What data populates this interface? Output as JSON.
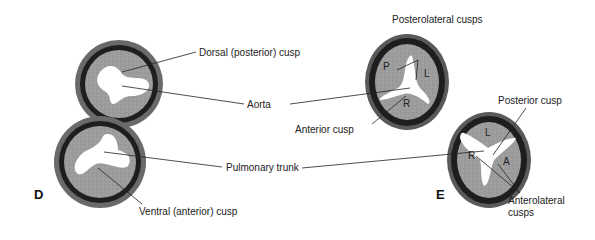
{
  "panels": {
    "D": {
      "label": "D",
      "labels": {
        "dorsal": "Dorsal (posterior) cusp",
        "ventral": "Ventral (anterior) cusp"
      }
    },
    "E": {
      "label": "E",
      "labels": {
        "posterolateral": "Posterolateral cusps",
        "anterior": "Anterior cusp",
        "posterior": "Posterior cusp",
        "anterolateral_line1": "Anterolateral",
        "anterolateral_line2": "cusps"
      },
      "aorta_cusps": {
        "P": "P",
        "L": "L",
        "R": "R"
      },
      "pulmonary_cusps": {
        "L": "L",
        "R": "R",
        "A": "A"
      }
    }
  },
  "shared_labels": {
    "aorta": "Aorta",
    "pulmonary_trunk": "Pulmonary trunk"
  },
  "colors": {
    "outer_ring": "#5a5a5a",
    "dark_band": "#1e1e1e",
    "inner_fill": "#9a9a9a",
    "lumen": "#ffffff",
    "leader_line": "#222222"
  }
}
